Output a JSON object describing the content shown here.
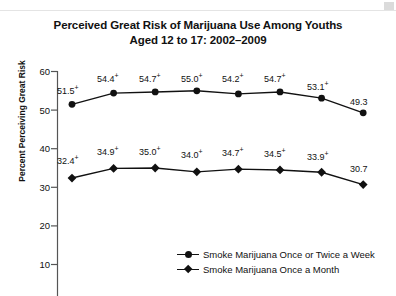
{
  "chart_data": {
    "type": "line",
    "title": "Perceived Great Risk of Marijuana Use Among Youths Aged 12 to 17: 2002–2009",
    "title_line1": "Perceived Great Risk of Marijuana Use Among Youths",
    "title_line2": "Aged 12 to 17: 2002–2009",
    "xlabel": "",
    "ylabel": "Percent Perceiving Great Risk",
    "ylim": [
      0,
      60
    ],
    "yticks": [
      10,
      20,
      30,
      40,
      50,
      60
    ],
    "ytick_labels": [
      "10",
      "20",
      "30",
      "40",
      "50",
      "60"
    ],
    "grid": false,
    "legend_position": "bottom-center",
    "categories": [
      "2002",
      "2003",
      "2004",
      "2005",
      "2006",
      "2007",
      "2008",
      "2009"
    ],
    "series": [
      {
        "name": "Smoke Marijuana Once or Twice a Week",
        "marker": "circle",
        "values": [
          51.5,
          54.4,
          54.7,
          55.0,
          54.2,
          54.7,
          53.1,
          49.3
        ],
        "labels": [
          "51.5",
          "54.4",
          "54.7",
          "55.0",
          "54.2",
          "54.7",
          "53.1",
          "49.3"
        ],
        "significance": [
          "+",
          "+",
          "+",
          "+",
          "+",
          "+",
          "+",
          ""
        ]
      },
      {
        "name": "Smoke Marijuana Once a Month",
        "marker": "diamond",
        "values": [
          32.4,
          34.9,
          35.0,
          34.0,
          34.7,
          34.5,
          33.9,
          30.7
        ],
        "labels": [
          "32.4",
          "34.9",
          "35.0",
          "34.0",
          "34.7",
          "34.5",
          "33.9",
          "30.7"
        ],
        "significance": [
          "+",
          "+",
          "+",
          "+",
          "+",
          "+",
          "+",
          ""
        ]
      }
    ]
  },
  "colors": {
    "line": "#111111",
    "axis": "#555555",
    "background": "#ffffff"
  }
}
